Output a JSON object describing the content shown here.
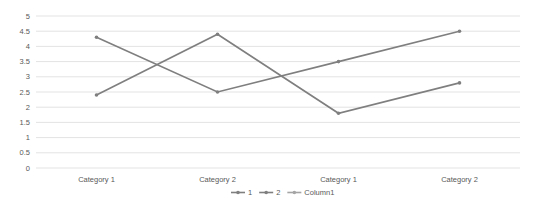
{
  "chart_data": {
    "type": "line",
    "title": "",
    "xlabel": "",
    "ylabel": "",
    "categories": [
      "Category 1",
      "Category 2",
      "Category 1",
      "Category 2"
    ],
    "yticks": [
      "0",
      "0.5",
      "1",
      "1.5",
      "2",
      "2.5",
      "3",
      "3.5",
      "4",
      "4.5",
      "5"
    ],
    "ylim": [
      0,
      5
    ],
    "grid": true,
    "legend_position": "bottom",
    "series": [
      {
        "name": "1",
        "values": [
          4.3,
          2.5,
          3.5,
          4.5
        ],
        "color": "#7f7f7f"
      },
      {
        "name": "2",
        "values": [
          2.4,
          4.4,
          1.8,
          2.8
        ],
        "color": "#7f7f7f"
      },
      {
        "name": "Column1",
        "values": [
          null,
          null,
          null,
          null
        ],
        "color": "#a5a5a5"
      }
    ]
  }
}
